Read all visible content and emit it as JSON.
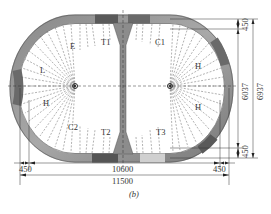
{
  "figure": {
    "caption": "(b)",
    "colors": {
      "lining_dark": "#6e6e6e",
      "lining_mid": "#9a9a9a",
      "lining_light": "#c8c8c8",
      "line": "#333333",
      "dashed": "#555555",
      "background": "#ffffff"
    },
    "region_labels": {
      "E": "E",
      "T1": "T1",
      "C1": "C1",
      "L": "L",
      "H_left": "H",
      "H_right_top": "H",
      "H_right_bottom": "H",
      "C2": "C2",
      "T2": "T2",
      "T3": "T3"
    },
    "dimensions": {
      "bottom_left_offset": "450",
      "inner_width": "10600",
      "bottom_right_offset": "450",
      "overall_width": "11500",
      "right_top_offset": "450",
      "inner_height": "6037",
      "overall_height": "6937",
      "right_bottom_offset": "450"
    }
  }
}
